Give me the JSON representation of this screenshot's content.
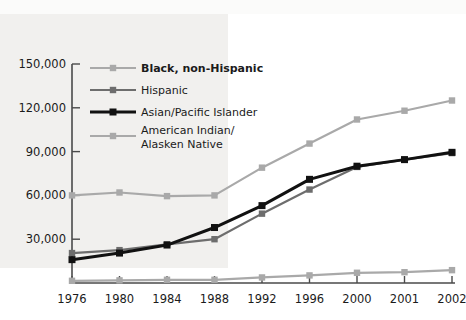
{
  "chart_data": {
    "type": "line",
    "title": "",
    "subtitle": "",
    "xlabel": "",
    "ylabel": "",
    "categories": [
      "1976",
      "1980",
      "1984",
      "1988",
      "1992",
      "1996",
      "2000",
      "2001",
      "2002"
    ],
    "ylim": [
      0,
      150000
    ],
    "yticks": [
      0,
      30000,
      60000,
      90000,
      120000,
      150000
    ],
    "ytick_labels": [
      "",
      "30,000",
      "60,000",
      "90,000",
      "120,000",
      "150,000"
    ],
    "grid": false,
    "legend_position": "top-left-inside",
    "series": [
      {
        "name": "Black, non-Hispanic",
        "color": "#a9a9a9",
        "marker": "square",
        "emphasis": "bold",
        "values": [
          60000,
          62000,
          59500,
          60000,
          79000,
          95500,
          112000,
          118000,
          125000
        ]
      },
      {
        "name": "Hispanic",
        "color": "#6d6d6d",
        "marker": "square",
        "emphasis": "normal",
        "values": [
          20500,
          22500,
          26500,
          30000,
          47500,
          64000,
          79500,
          84500,
          89000
        ]
      },
      {
        "name": "Asian/Pacific Islander",
        "color": "#111111",
        "marker": "square",
        "emphasis": "normal",
        "values": [
          16000,
          20500,
          26000,
          38000,
          53000,
          71000,
          80000,
          84500,
          89500
        ]
      },
      {
        "name": "American Indian/\nAlasken Native",
        "color": "#a9a9a9",
        "marker": "square",
        "emphasis": "normal",
        "values": [
          1500,
          1800,
          2200,
          2200,
          3800,
          5200,
          7000,
          7400,
          8800
        ]
      }
    ]
  },
  "legend": {
    "items": [
      {
        "label": "Black, non-Hispanic",
        "color": "#a9a9a9",
        "bold": true
      },
      {
        "label": "Hispanic",
        "color": "#6d6d6d",
        "bold": false
      },
      {
        "label": "Asian/Pacific Islander",
        "color": "#111111",
        "bold": false
      },
      {
        "label_line1": "American Indian/",
        "label_line2": "Alasken Native",
        "color": "#a9a9a9",
        "bold": false
      }
    ]
  },
  "axes": {
    "y_labels": [
      "150,000",
      "120,000",
      "90,000",
      "60,000",
      "30,000"
    ],
    "x_labels": [
      "1976",
      "1980",
      "1984",
      "1988",
      "1992",
      "1996",
      "2000",
      "2001",
      "2002"
    ],
    "axis_color": "#4a4a4a"
  }
}
